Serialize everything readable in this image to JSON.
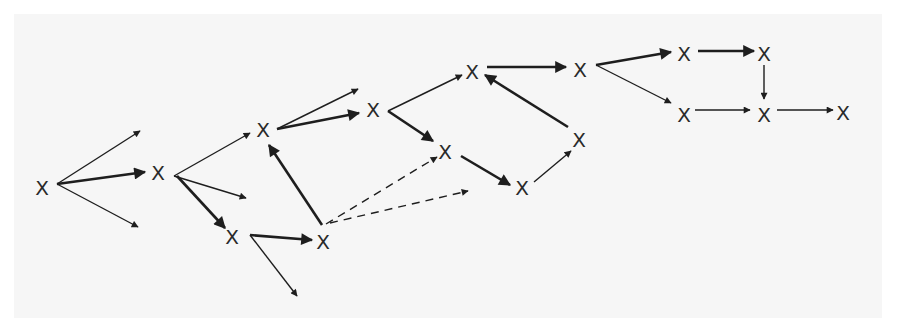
{
  "diagram": {
    "title": "",
    "colors": {
      "background": "#ffffff",
      "panel": "#f6f6f6",
      "ink": "#1e1e1e"
    },
    "nodes": [
      {
        "id": "n1",
        "label": "X",
        "x": 42,
        "y": 188
      },
      {
        "id": "n2",
        "label": "X",
        "x": 158,
        "y": 173
      },
      {
        "id": "n3",
        "label": "X",
        "x": 263,
        "y": 130
      },
      {
        "id": "n4",
        "label": "X",
        "x": 232,
        "y": 237
      },
      {
        "id": "n5",
        "label": "X",
        "x": 323,
        "y": 242
      },
      {
        "id": "n6",
        "label": "X",
        "x": 373,
        "y": 110
      },
      {
        "id": "n7",
        "label": "X",
        "x": 445,
        "y": 152
      },
      {
        "id": "n8",
        "label": "X",
        "x": 472,
        "y": 72
      },
      {
        "id": "n9",
        "label": "X",
        "x": 522,
        "y": 188
      },
      {
        "id": "n10",
        "label": "X",
        "x": 579,
        "y": 140
      },
      {
        "id": "n11",
        "label": "X",
        "x": 580,
        "y": 70
      },
      {
        "id": "n12",
        "label": "X",
        "x": 684,
        "y": 54
      },
      {
        "id": "n13",
        "label": "X",
        "x": 764,
        "y": 54
      },
      {
        "id": "n14",
        "label": "X",
        "x": 684,
        "y": 115
      },
      {
        "id": "n15",
        "label": "X",
        "x": 764,
        "y": 115
      },
      {
        "id": "n16",
        "label": "X",
        "x": 843,
        "y": 113
      }
    ],
    "edges": [
      {
        "x1": 57,
        "y1": 184,
        "x2": 140,
        "y2": 131,
        "style": "thin"
      },
      {
        "x1": 57,
        "y1": 184,
        "x2": 145,
        "y2": 172,
        "style": "thick"
      },
      {
        "x1": 57,
        "y1": 184,
        "x2": 138,
        "y2": 227,
        "style": "thin"
      },
      {
        "x1": 174,
        "y1": 176,
        "x2": 250,
        "y2": 133,
        "style": "thin"
      },
      {
        "x1": 174,
        "y1": 176,
        "x2": 246,
        "y2": 198,
        "style": "thin"
      },
      {
        "x1": 177,
        "y1": 176,
        "x2": 225,
        "y2": 228,
        "style": "thick"
      },
      {
        "x1": 277,
        "y1": 129,
        "x2": 358,
        "y2": 89,
        "style": "thin"
      },
      {
        "x1": 277,
        "y1": 129,
        "x2": 359,
        "y2": 113,
        "style": "thick"
      },
      {
        "x1": 250,
        "y1": 235,
        "x2": 312,
        "y2": 240,
        "style": "thick"
      },
      {
        "x1": 250,
        "y1": 235,
        "x2": 297,
        "y2": 296,
        "style": "thin"
      },
      {
        "x1": 322,
        "y1": 225,
        "x2": 269,
        "y2": 145,
        "style": "thick"
      },
      {
        "x1": 326,
        "y1": 224,
        "x2": 437,
        "y2": 157,
        "style": "dashed"
      },
      {
        "x1": 330,
        "y1": 223,
        "x2": 468,
        "y2": 191,
        "style": "dashed"
      },
      {
        "x1": 388,
        "y1": 111,
        "x2": 462,
        "y2": 75,
        "style": "thin"
      },
      {
        "x1": 388,
        "y1": 111,
        "x2": 433,
        "y2": 141,
        "style": "thick"
      },
      {
        "x1": 461,
        "y1": 156,
        "x2": 510,
        "y2": 185,
        "style": "thick"
      },
      {
        "x1": 534,
        "y1": 182,
        "x2": 571,
        "y2": 151,
        "style": "thin"
      },
      {
        "x1": 568,
        "y1": 127,
        "x2": 485,
        "y2": 75,
        "style": "thick"
      },
      {
        "x1": 487,
        "y1": 67,
        "x2": 566,
        "y2": 67,
        "style": "thick"
      },
      {
        "x1": 596,
        "y1": 65,
        "x2": 671,
        "y2": 52,
        "style": "thick"
      },
      {
        "x1": 596,
        "y1": 65,
        "x2": 671,
        "y2": 103,
        "style": "thin"
      },
      {
        "x1": 698,
        "y1": 51,
        "x2": 754,
        "y2": 51,
        "style": "thick"
      },
      {
        "x1": 764,
        "y1": 65,
        "x2": 764,
        "y2": 99,
        "style": "thin"
      },
      {
        "x1": 695,
        "y1": 110,
        "x2": 750,
        "y2": 110,
        "style": "thin"
      },
      {
        "x1": 777,
        "y1": 110,
        "x2": 833,
        "y2": 110,
        "style": "thin"
      }
    ]
  }
}
